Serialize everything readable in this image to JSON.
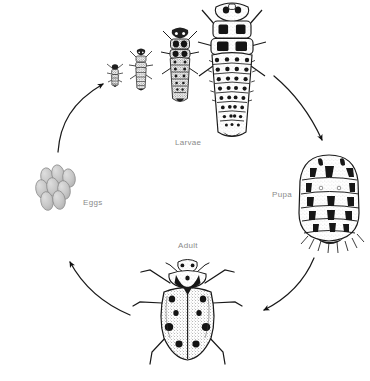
{
  "figure": {
    "background_color": "#ffffff",
    "label_color": "#8a8a8a",
    "ink_color": "#1a1a1a",
    "egg_fill_color": "#c9c9c9",
    "egg_outline_color": "#8d8d8d"
  },
  "labels": {
    "larvae": "Larvae",
    "eggs": "Eggs",
    "pupa": "Pupa",
    "adult": "Adult"
  },
  "stages": [
    {
      "name": "eggs",
      "label": "Eggs",
      "order": 1,
      "count_drawn": 8,
      "description": "cluster of upright oval eggs"
    },
    {
      "name": "larvae",
      "label": "Larvae",
      "order": 2,
      "count_drawn": 4,
      "description": "four larval instars increasing in size left to right"
    },
    {
      "name": "pupa",
      "label": "Pupa",
      "order": 3,
      "count_drawn": 1,
      "description": "oval banded pupa attached at rear"
    },
    {
      "name": "adult",
      "label": "Adult",
      "order": 4,
      "count_drawn": 1,
      "description": "spotted adult ladybird beetle, dorsal view"
    }
  ],
  "arrows": [
    {
      "from": "eggs",
      "to": "larvae",
      "direction": "up-right"
    },
    {
      "from": "larvae",
      "to": "pupa",
      "direction": "down-right"
    },
    {
      "from": "pupa",
      "to": "adult",
      "direction": "down-left"
    },
    {
      "from": "adult",
      "to": "eggs",
      "direction": "up-left"
    }
  ],
  "adult_detail": {
    "elytra_spot_count": 8,
    "pronotum_spot_count": 2,
    "leg_count": 6,
    "antenna_count": 2
  }
}
